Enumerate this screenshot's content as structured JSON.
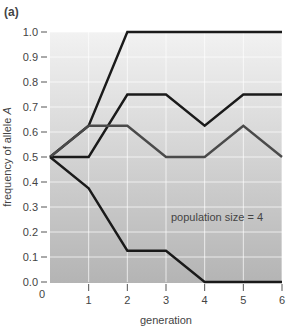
{
  "panel_label": "(a)",
  "chart_data": {
    "type": "line",
    "title": "",
    "xlabel": "generation",
    "ylabel": "frequency of allele A",
    "x": [
      0,
      1,
      2,
      3,
      4,
      5,
      6
    ],
    "xticks": [
      "0",
      "1",
      "2",
      "3",
      "4",
      "5",
      "6"
    ],
    "yticks": [
      "0.0",
      "0.1",
      "0.2",
      "0.3",
      "0.4",
      "0.5",
      "0.6",
      "0.7",
      "0.8",
      "0.9",
      "1.0"
    ],
    "xlim": [
      0,
      6
    ],
    "ylim": [
      0,
      1.0
    ],
    "grid": true,
    "annotation": "population size = 4",
    "series": [
      {
        "name": "run 1",
        "color": "#1a1a1a",
        "values": [
          0.5,
          0.625,
          1.0,
          1.0,
          1.0,
          1.0,
          1.0
        ]
      },
      {
        "name": "run 2",
        "color": "#1a1a1a",
        "values": [
          0.5,
          0.5,
          0.75,
          0.75,
          0.625,
          0.75,
          0.75
        ]
      },
      {
        "name": "run 3",
        "color": "#4a4a4a",
        "values": [
          0.5,
          0.625,
          0.625,
          0.5,
          0.5,
          0.625,
          0.5
        ]
      },
      {
        "name": "run 4",
        "color": "#1a1a1a",
        "values": [
          0.5,
          0.375,
          0.125,
          0.125,
          0.0,
          0.0,
          0.0
        ]
      }
    ]
  }
}
